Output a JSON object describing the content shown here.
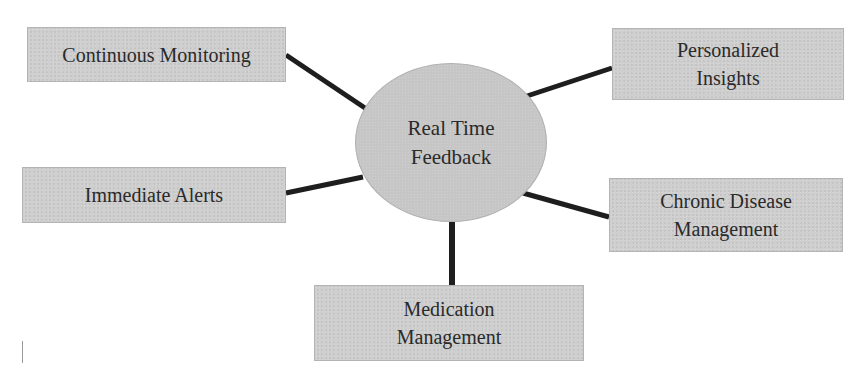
{
  "diagram": {
    "type": "hub-and-spoke",
    "center": {
      "label": "Real Time\nFeedback"
    },
    "nodes": [
      {
        "id": "continuous-monitoring",
        "label": "Continuous Monitoring"
      },
      {
        "id": "personalized-insights",
        "label": "Personalized\nInsights"
      },
      {
        "id": "immediate-alerts",
        "label": "Immediate Alerts"
      },
      {
        "id": "chronic-disease-management",
        "label": "Chronic Disease\nManagement"
      },
      {
        "id": "medication-management",
        "label": "Medication\nManagement"
      }
    ],
    "edges": [
      {
        "from": "center",
        "to": "continuous-monitoring"
      },
      {
        "from": "center",
        "to": "personalized-insights"
      },
      {
        "from": "center",
        "to": "immediate-alerts"
      },
      {
        "from": "center",
        "to": "chronic-disease-management"
      },
      {
        "from": "center",
        "to": "medication-management"
      }
    ],
    "colors": {
      "box_fill": "#cfcfcf",
      "ellipse_fill": "#c6c6c6",
      "connector": "#1e1e1e",
      "text": "#2a2a2a"
    }
  }
}
